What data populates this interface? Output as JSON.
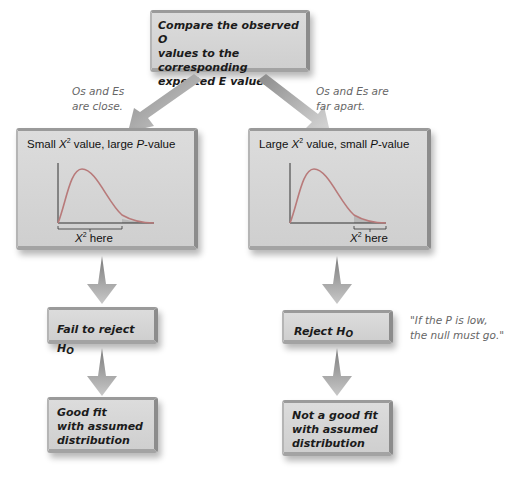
{
  "top_box": {
    "line1": "Compare the observed O",
    "line2": "values to the corresponding",
    "line3": "expected E values."
  },
  "branches": {
    "left": {
      "note_line1": "Os and Es",
      "note_line2": "are close.",
      "chart_title_pre": "Small ",
      "chart_title_x": "X",
      "chart_title_sup": "2",
      "chart_title_mid": " value, large ",
      "chart_title_p": "P",
      "chart_title_post": "-value",
      "xlabel_x": "X",
      "xlabel_sup": "2",
      "xlabel_post": " here",
      "decision_pre": "Fail to reject H",
      "decision_sub": "O",
      "conclusion_line1": "Good fit",
      "conclusion_line2": "with assumed",
      "conclusion_line3": "distribution"
    },
    "right": {
      "note_line1": "Os and Es are",
      "note_line2": "far apart.",
      "chart_title_pre": "Large ",
      "chart_title_x": "X",
      "chart_title_sup": "2",
      "chart_title_mid": " value, small ",
      "chart_title_p": "P",
      "chart_title_post": "-value",
      "xlabel_x": "X",
      "xlabel_sup": "2",
      "xlabel_post": " here",
      "decision_pre": "Reject H",
      "decision_sub": "O",
      "conclusion_line1": "Not a good fit",
      "conclusion_line2": "with assumed",
      "conclusion_line3": "distribution"
    }
  },
  "quote": {
    "line1_pre": "\"If the ",
    "line1_p": "P",
    "line1_post": " is low,",
    "line2": "the null must go.\""
  },
  "colors": {
    "box_fill": "#d6d6d6",
    "box_border": "#8c8c8c",
    "curve": "#b87a7a",
    "tail_shade": "#b8b8b8",
    "arrow": "#a8a8a8",
    "note_text": "#666666"
  }
}
